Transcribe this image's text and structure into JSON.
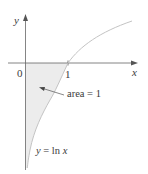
{
  "figure": {
    "axes": {
      "y_label": "y",
      "x_label": "x",
      "origin_label": "0",
      "tick_label_1": "1"
    },
    "annotations": {
      "area_label": "area = 1",
      "curve_label_y": "y",
      "curve_label_eq": "= ln",
      "curve_label_x": "x"
    },
    "curve": {
      "function": "y = ln x",
      "color": "#c8c8c8"
    },
    "shaded_region": {
      "description": "region between y = ln x and the y-axis, below the x-axis, 0 < x < 1",
      "fill": "#ececec"
    },
    "colors": {
      "axis": "#555555",
      "text": "#3a3a3a"
    }
  }
}
